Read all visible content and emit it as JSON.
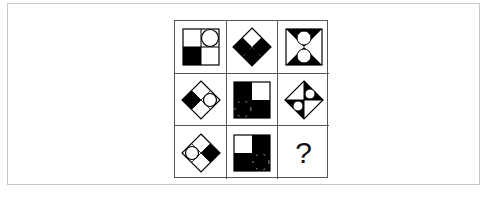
{
  "puzzle": {
    "rows": 3,
    "cols": 3,
    "cells": [
      {
        "id": "r1c1",
        "desc": "square, 2x2 quadrants: bottom-left black, top-right white circle"
      },
      {
        "id": "r1c2",
        "desc": "diamond, left and right quadrants black, black circle in bottom quadrant; top white (reading uncertain)"
      },
      {
        "id": "r1c3",
        "desc": "square hourglass: top and bottom black triangles, two white circles stacked"
      },
      {
        "id": "r2c1",
        "desc": "diamond, left quadrant black, right quadrant white circle"
      },
      {
        "id": "r2c2",
        "desc": "square, top-left and bottom-right black, black circle in bottom-left"
      },
      {
        "id": "r2c3",
        "desc": "diamond split diagonally, two black triangles with white circles"
      },
      {
        "id": "r3c1",
        "desc": "diamond, right quadrant black, left quadrant white circle"
      },
      {
        "id": "r3c2",
        "desc": "square, top-right and bottom-left black, black circle bottom-right"
      },
      {
        "id": "r3c3",
        "desc": "missing answer"
      }
    ],
    "question_mark": "?"
  },
  "colors": {
    "ink": "#000000",
    "grid_line": "#555555",
    "frame_border": "#c8c8c8",
    "background": "#ffffff"
  }
}
